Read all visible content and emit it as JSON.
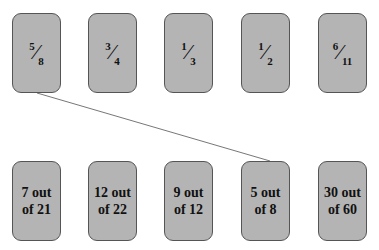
{
  "fractions": [
    {
      "num": "5",
      "den": "8"
    },
    {
      "num": "3",
      "den": "4"
    },
    {
      "num": "1",
      "den": "3"
    },
    {
      "num": "1",
      "den": "2"
    },
    {
      "num": "6",
      "den": "11"
    }
  ],
  "ratios": [
    {
      "line1": "7 out",
      "line2": "of 21"
    },
    {
      "line1": "12 out",
      "line2": "of 22"
    },
    {
      "line1": "9 out",
      "line2": "of 12"
    },
    {
      "line1": "5 out",
      "line2": "of 8"
    },
    {
      "line1": "30 out",
      "line2": "of 60"
    }
  ],
  "connection": {
    "from": "fraction-card-5/8",
    "to": "ratio-card-5-out-of-8"
  },
  "colors": {
    "card_fill": "#b4b4b4",
    "card_border": "#555555",
    "line": "#777777"
  }
}
